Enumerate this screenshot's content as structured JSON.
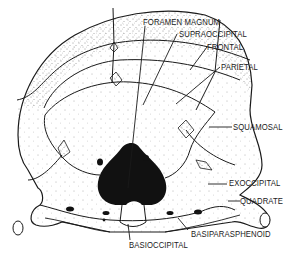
{
  "diagram": {
    "ink_color": "#1a1a1a",
    "background_color": "#ffffff",
    "labels": [
      {
        "id": "foramen-magnum",
        "text": "FORAMEN MAGNUM"
      },
      {
        "id": "supraoccipital",
        "text": "SUPRAOCCIPITAL"
      },
      {
        "id": "frontal",
        "text": "FRONTAL"
      },
      {
        "id": "parietal",
        "text": "PARIETAL"
      },
      {
        "id": "squamosal",
        "text": "SQUAMOSAL"
      },
      {
        "id": "exoccipital",
        "text": "EXOCCIPITAL"
      },
      {
        "id": "quadrate",
        "text": "QUADRATE"
      },
      {
        "id": "basiparasphenoid",
        "text": "BASIPARASPHENOID"
      },
      {
        "id": "basioccipital",
        "text": "BASIOCCIPITAL"
      }
    ]
  }
}
